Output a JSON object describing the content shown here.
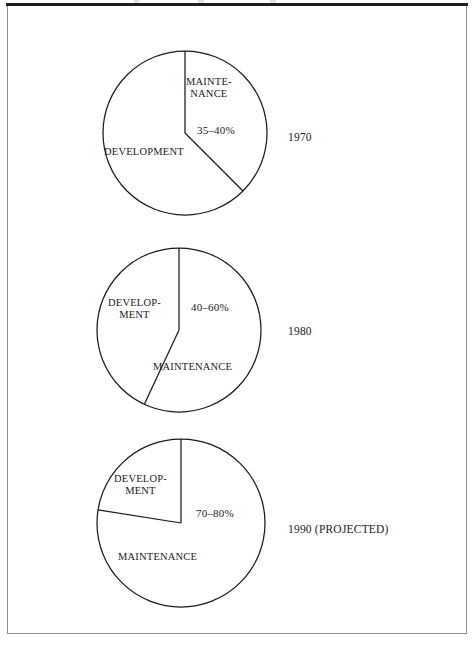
{
  "figure": {
    "background_color": "#ffffff",
    "frame_color": "#8d8d8d",
    "rule_color": "#1d1d1d",
    "ink_color": "#1a1a1a"
  },
  "charts": [
    {
      "year_label": "1970",
      "development_label": "DEVELOPMENT",
      "maintenance_label": "MAINTE-\nNANCE",
      "percent_label": "35–40%"
    },
    {
      "year_label": "1980",
      "development_label": "DEVELOP-\nMENT",
      "maintenance_label": "MAINTENANCE",
      "percent_label": "40–60%"
    },
    {
      "year_label": "1990 (PROJECTED)",
      "development_label": "DEVELOP-\nMENT",
      "maintenance_label": "MAINTENANCE",
      "percent_label": "70–80%"
    }
  ],
  "chart_data": {
    "type": "pie",
    "title": "",
    "subtitle": "",
    "xlabel": "",
    "ylabel": "",
    "legend_position": "none",
    "grid": false,
    "note": "Three pie charts showing the split between software maintenance and development effort over time. The maintenance wedge of each pie is annotated with a percentage range.",
    "charts": [
      {
        "name": "1970",
        "year_label": "1970",
        "labels": [
          "MAINTENANCE",
          "DEVELOPMENT"
        ],
        "values": [
          37.5,
          62.5
        ],
        "value_ranges": [
          [
            35,
            40
          ],
          [
            60,
            65
          ]
        ],
        "annotation": "35–40%",
        "annotated_slice": "MAINTENANCE",
        "slice_start_angle_deg": 0,
        "slice_end_angle_deg": 135,
        "units": "percent"
      },
      {
        "name": "1980",
        "year_label": "1980",
        "labels": [
          "MAINTENANCE",
          "DEVELOPMENT"
        ],
        "values": [
          50,
          50
        ],
        "value_ranges": [
          [
            40,
            60
          ],
          [
            40,
            60
          ]
        ],
        "annotation": "40–60%",
        "annotated_slice": "MAINTENANCE",
        "slice_start_angle_deg": 0,
        "slice_end_angle_deg": 205,
        "units": "percent"
      },
      {
        "name": "1990 (PROJECTED)",
        "year_label": "1990 (PROJECTED)",
        "labels": [
          "MAINTENANCE",
          "DEVELOPMENT"
        ],
        "values": [
          77.5,
          22.5
        ],
        "value_ranges": [
          [
            70,
            80
          ],
          [
            20,
            30
          ]
        ],
        "annotation": "70–80%",
        "annotated_slice": "MAINTENANCE",
        "slice_start_angle_deg": 0,
        "slice_end_angle_deg": 279,
        "units": "percent"
      }
    ]
  },
  "geometry": {
    "pies": [
      {
        "cx": 185,
        "cy": 133,
        "r": 82,
        "cut_angle_deg": 135
      },
      {
        "cx": 179,
        "cy": 330,
        "r": 82,
        "cut_angle_deg": 205
      },
      {
        "cx": 181,
        "cy": 523,
        "r": 84,
        "cut_angle_deg": 279
      }
    ]
  },
  "text_positions": {
    "p0_maintenance": {
      "left": 186,
      "top": 76
    },
    "p0_percent": {
      "left": 197,
      "top": 124
    },
    "p0_development": {
      "left": 104,
      "top": 146
    },
    "p0_year": {
      "left": 288,
      "top": 131
    },
    "p1_development": {
      "left": 108,
      "top": 297
    },
    "p1_percent": {
      "left": 191,
      "top": 301
    },
    "p1_maintenance": {
      "left": 153,
      "top": 361
    },
    "p1_year": {
      "left": 288,
      "top": 325
    },
    "p2_development": {
      "left": 114,
      "top": 473
    },
    "p2_percent": {
      "left": 196,
      "top": 507
    },
    "p2_maintenance": {
      "left": 118,
      "top": 551
    },
    "p2_year": {
      "left": 288,
      "top": 523
    }
  }
}
